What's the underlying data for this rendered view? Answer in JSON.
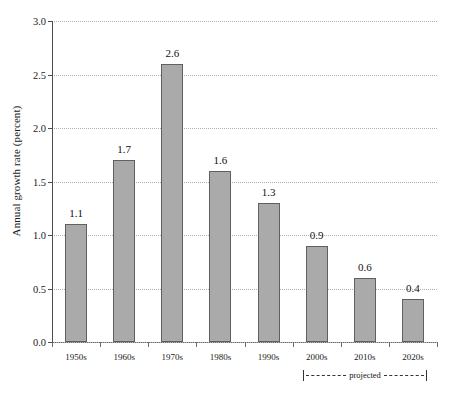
{
  "chart_data": {
    "type": "bar",
    "title": "",
    "xlabel": "",
    "ylabel": "Annual growth rate (percent)",
    "categories": [
      "1950s",
      "1960s",
      "1970s",
      "1980s",
      "1990s",
      "2000s",
      "2010s",
      "2020s"
    ],
    "values": [
      1.1,
      1.7,
      2.6,
      1.6,
      1.3,
      0.9,
      0.6,
      0.4
    ],
    "value_labels": [
      "1.1",
      "1.7",
      "2.6",
      "1.6",
      "1.3",
      "0.9",
      "0.6",
      "0.4"
    ],
    "ylim": [
      0.0,
      3.0
    ],
    "ytick_labels": [
      "0.0",
      "0.5",
      "1.0",
      "1.5",
      "2.0",
      "2.5",
      "3.0"
    ],
    "ytick_values": [
      0.0,
      0.5,
      1.0,
      1.5,
      2.0,
      2.5,
      3.0
    ],
    "grid": true,
    "grid_style": "dotted-horizontal",
    "legend": "none",
    "bar_color": "#aaaaaa",
    "bar_edge_color": "#606060",
    "annotations": [
      {
        "text": "projected",
        "style": "dashed-bracket",
        "covers_categories": [
          "2000s",
          "2010s",
          "2020s"
        ]
      }
    ]
  },
  "annotation": {
    "projected_label": "projected"
  }
}
